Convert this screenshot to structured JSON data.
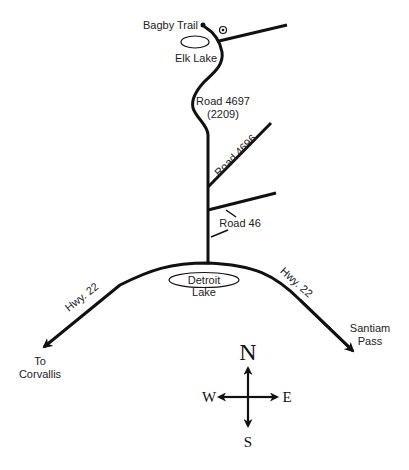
{
  "map": {
    "title": "Directions to Bagby Trail",
    "colors": {
      "road": "#111111",
      "text": "#222222",
      "background": "#ffffff"
    },
    "places": {
      "trailhead": "Bagby Trail",
      "elk_lake": "Elk Lake",
      "detroit_lake_1": "Detroit",
      "detroit_lake_2": "Lake",
      "corvallis_1": "To",
      "corvallis_2": "Corvallis",
      "santiam_1": "Santiam",
      "santiam_2": "Pass"
    },
    "roads": {
      "road_4697": "Road 4697",
      "road_4697_alt": "(2209)",
      "road_4696": "Road 4696",
      "road_46": "Road 46",
      "hwy22_west": "Hwy. 22",
      "hwy22_east": "Hwy. 22"
    },
    "compass": {
      "north": "N",
      "south": "S",
      "east": "E",
      "west": "W"
    }
  }
}
